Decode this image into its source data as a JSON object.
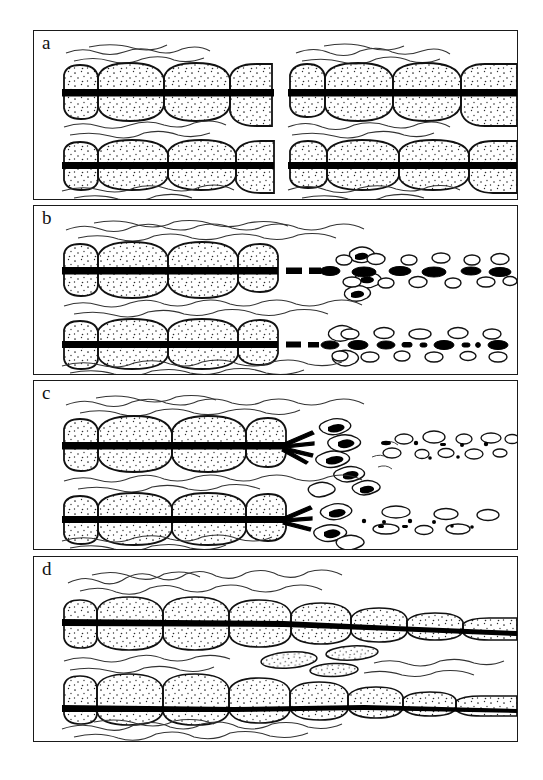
{
  "figure": {
    "kind": "geological-schematic",
    "background_color": "#ffffff",
    "line_color": "#1a1a1a",
    "stipple_color": "#2a2a2a",
    "band_color": "#000000",
    "panel_count": 4
  },
  "panels": [
    {
      "id": "a",
      "label": "a",
      "state": "continuous-beds",
      "bed_count": 2,
      "has_black_band": true,
      "band_continuous": true,
      "clast_field": false,
      "shale_bands": 3,
      "nodule_rows": [
        {
          "row": "upper",
          "nodules": 6
        },
        {
          "row": "lower",
          "nodules": 6
        }
      ]
    },
    {
      "id": "b",
      "label": "b",
      "state": "band-breaks-into-clasts",
      "bed_count": 2,
      "has_black_band": true,
      "band_continuous": false,
      "clast_field": true,
      "clast_density": "high",
      "shale_bands": 3,
      "nodule_rows": [
        {
          "row": "upper",
          "nodules": 4
        },
        {
          "row": "lower",
          "nodules": 4
        }
      ]
    },
    {
      "id": "c",
      "label": "c",
      "state": "band-frays-sparse-clasts",
      "bed_count": 2,
      "has_black_band": true,
      "band_continuous": false,
      "band_splays": true,
      "clast_field": true,
      "clast_density": "low",
      "shale_bands": 3,
      "nodule_rows": [
        {
          "row": "upper",
          "nodules": 4
        },
        {
          "row": "lower",
          "nodules": 4
        }
      ]
    },
    {
      "id": "d",
      "label": "d",
      "state": "beds-thin-and-merge",
      "bed_count": 2,
      "has_black_band": true,
      "band_continuous": true,
      "clast_field": false,
      "tapering": true,
      "shale_bands": 3,
      "nodule_rows": [
        {
          "row": "upper",
          "nodules": 7
        },
        {
          "row": "lower",
          "nodules": 7
        }
      ]
    }
  ]
}
